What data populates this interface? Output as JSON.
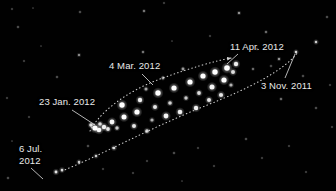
{
  "figure": {
    "kind": "sky-chart",
    "background_color": "#010101",
    "label_color": "#e9e9e9",
    "marker_color": "#ffffff",
    "width": 336,
    "height": 191
  },
  "labels": [
    {
      "id": "apr",
      "text": "11 Apr. 2012",
      "x": 230,
      "y": 42
    },
    {
      "id": "mar",
      "text": "4 Mar. 2012",
      "x": 109,
      "y": 61
    },
    {
      "id": "nov",
      "text": "3 Nov. 2011",
      "x": 261,
      "y": 81
    },
    {
      "id": "jan",
      "text": "23 Jan. 2012",
      "x": 39,
      "y": 97
    }
  ],
  "labels_multiline": [
    {
      "id": "jul",
      "line1": "6 Jul.",
      "line2": "2012",
      "x": 19,
      "y": 143
    }
  ],
  "leader_lines": [
    {
      "id": "leader-apr",
      "x1": 238,
      "y1": 54,
      "x2": 227,
      "y2": 64
    },
    {
      "id": "leader-mar",
      "x1": 142,
      "y1": 74,
      "x2": 153,
      "y2": 85
    },
    {
      "id": "leader-nov",
      "x1": 285,
      "y1": 78,
      "x2": 295,
      "y2": 54
    },
    {
      "id": "leader-jan",
      "x1": 72,
      "y1": 110,
      "x2": 95,
      "y2": 125
    },
    {
      "id": "leader-jul",
      "x1": 31,
      "y1": 168,
      "x2": 43,
      "y2": 179
    }
  ],
  "paths": [
    {
      "id": "upper-track",
      "description": "upper dotted retrograde track, 23 Jan. 2012 through 11 Apr. 2012",
      "d": "M 90 131 C 99 113, 125 92, 160 79 C 190 68, 215 61, 231 58"
    },
    {
      "id": "lower-track",
      "description": "lower dotted direct track, 6 Jul. 2012 through 3 Nov. 2011",
      "d": "M 62 171 C 95 158, 150 128, 205 106 C 250 88, 285 70, 298 52"
    }
  ],
  "markers": [
    {
      "x": 95,
      "y": 128,
      "r": 2.6,
      "b": 1.0
    },
    {
      "x": 99,
      "y": 130,
      "r": 2.3,
      "b": 0.95
    },
    {
      "x": 104,
      "y": 127,
      "r": 2.2,
      "b": 0.9
    },
    {
      "x": 91,
      "y": 125,
      "r": 1.8,
      "b": 0.8
    },
    {
      "x": 100,
      "y": 124,
      "r": 1.8,
      "b": 0.8
    },
    {
      "x": 108,
      "y": 129,
      "r": 1.9,
      "b": 0.85
    },
    {
      "x": 112,
      "y": 122,
      "r": 2.4,
      "b": 0.95
    },
    {
      "x": 117,
      "y": 128,
      "r": 1.7,
      "b": 0.7
    },
    {
      "x": 124,
      "y": 117,
      "r": 2.5,
      "b": 1.0
    },
    {
      "x": 122,
      "y": 105,
      "r": 2.7,
      "b": 1.0
    },
    {
      "x": 134,
      "y": 126,
      "r": 2.0,
      "b": 0.85
    },
    {
      "x": 137,
      "y": 112,
      "r": 2.6,
      "b": 1.0
    },
    {
      "x": 140,
      "y": 100,
      "r": 2.2,
      "b": 0.9
    },
    {
      "x": 147,
      "y": 131,
      "r": 1.8,
      "b": 0.75
    },
    {
      "x": 152,
      "y": 120,
      "r": 1.6,
      "b": 0.6
    },
    {
      "x": 155,
      "y": 107,
      "r": 2.0,
      "b": 0.85
    },
    {
      "x": 158,
      "y": 93,
      "r": 2.7,
      "b": 1.0
    },
    {
      "x": 166,
      "y": 116,
      "r": 2.4,
      "b": 0.95
    },
    {
      "x": 170,
      "y": 103,
      "r": 1.8,
      "b": 0.75
    },
    {
      "x": 174,
      "y": 88,
      "r": 2.6,
      "b": 1.0
    },
    {
      "x": 180,
      "y": 112,
      "r": 2.3,
      "b": 0.9
    },
    {
      "x": 186,
      "y": 98,
      "r": 1.7,
      "b": 0.7
    },
    {
      "x": 190,
      "y": 82,
      "r": 2.6,
      "b": 1.0
    },
    {
      "x": 196,
      "y": 108,
      "r": 2.2,
      "b": 0.9
    },
    {
      "x": 199,
      "y": 93,
      "r": 1.9,
      "b": 0.8
    },
    {
      "x": 203,
      "y": 76,
      "r": 2.6,
      "b": 1.0
    },
    {
      "x": 209,
      "y": 100,
      "r": 2.0,
      "b": 0.85
    },
    {
      "x": 212,
      "y": 87,
      "r": 2.5,
      "b": 0.95
    },
    {
      "x": 215,
      "y": 72,
      "r": 2.7,
      "b": 1.0
    },
    {
      "x": 221,
      "y": 95,
      "r": 2.1,
      "b": 0.85
    },
    {
      "x": 224,
      "y": 80,
      "r": 2.6,
      "b": 1.0
    },
    {
      "x": 227,
      "y": 68,
      "r": 2.8,
      "b": 1.0
    },
    {
      "x": 233,
      "y": 72,
      "r": 2.0,
      "b": 0.8
    },
    {
      "x": 236,
      "y": 64,
      "r": 2.2,
      "b": 0.9
    },
    {
      "x": 231,
      "y": 85,
      "r": 1.6,
      "b": 0.6
    },
    {
      "x": 146,
      "y": 89,
      "r": 1.5,
      "b": 0.55
    },
    {
      "x": 163,
      "y": 78,
      "r": 1.4,
      "b": 0.5
    },
    {
      "x": 183,
      "y": 69,
      "r": 1.4,
      "b": 0.5
    }
  ],
  "stars": [
    {
      "x": 12,
      "y": 9,
      "r": 0.7,
      "b": 0.35
    },
    {
      "x": 33,
      "y": 8,
      "r": 0.6,
      "b": 0.3
    },
    {
      "x": 80,
      "y": 12,
      "r": 0.8,
      "b": 0.4
    },
    {
      "x": 144,
      "y": 11,
      "r": 0.9,
      "b": 0.5
    },
    {
      "x": 239,
      "y": 13,
      "r": 1.0,
      "b": 0.6
    },
    {
      "x": 164,
      "y": 3,
      "r": 0.7,
      "b": 0.35
    },
    {
      "x": 18,
      "y": 27,
      "r": 0.8,
      "b": 0.4
    },
    {
      "x": 79,
      "y": 55,
      "r": 1.0,
      "b": 0.55
    },
    {
      "x": 143,
      "y": 52,
      "r": 0.9,
      "b": 0.5
    },
    {
      "x": 266,
      "y": 32,
      "r": 0.9,
      "b": 0.45
    },
    {
      "x": 316,
      "y": 42,
      "r": 1.2,
      "b": 0.75
    },
    {
      "x": 296,
      "y": 52,
      "r": 1.2,
      "b": 0.8
    },
    {
      "x": 279,
      "y": 59,
      "r": 1.0,
      "b": 0.6
    },
    {
      "x": 257,
      "y": 49,
      "r": 0.8,
      "b": 0.4
    },
    {
      "x": 253,
      "y": 69,
      "r": 0.9,
      "b": 0.45
    },
    {
      "x": 271,
      "y": 66,
      "r": 0.8,
      "b": 0.4
    },
    {
      "x": 303,
      "y": 76,
      "r": 0.8,
      "b": 0.4
    },
    {
      "x": 327,
      "y": 17,
      "r": 0.8,
      "b": 0.4
    },
    {
      "x": 330,
      "y": 85,
      "r": 0.7,
      "b": 0.35
    },
    {
      "x": 281,
      "y": 99,
      "r": 0.9,
      "b": 0.45
    },
    {
      "x": 316,
      "y": 108,
      "r": 0.8,
      "b": 0.4
    },
    {
      "x": 332,
      "y": 127,
      "r": 0.7,
      "b": 0.35
    },
    {
      "x": 24,
      "y": 61,
      "r": 0.7,
      "b": 0.35
    },
    {
      "x": 57,
      "y": 77,
      "r": 0.8,
      "b": 0.4
    },
    {
      "x": 7,
      "y": 98,
      "r": 0.7,
      "b": 0.35
    },
    {
      "x": 29,
      "y": 117,
      "r": 0.7,
      "b": 0.35
    },
    {
      "x": 12,
      "y": 141,
      "r": 0.6,
      "b": 0.3
    },
    {
      "x": 8,
      "y": 178,
      "r": 0.8,
      "b": 0.4
    },
    {
      "x": 56,
      "y": 172,
      "r": 1.4,
      "b": 0.85
    },
    {
      "x": 62,
      "y": 170,
      "r": 1.3,
      "b": 0.8
    },
    {
      "x": 79,
      "y": 162,
      "r": 1.2,
      "b": 0.75
    },
    {
      "x": 96,
      "y": 156,
      "r": 1.2,
      "b": 0.7
    },
    {
      "x": 114,
      "y": 148,
      "r": 1.3,
      "b": 0.8
    },
    {
      "x": 88,
      "y": 146,
      "r": 0.8,
      "b": 0.4
    },
    {
      "x": 103,
      "y": 169,
      "r": 0.7,
      "b": 0.35
    },
    {
      "x": 133,
      "y": 173,
      "r": 0.7,
      "b": 0.35
    },
    {
      "x": 147,
      "y": 161,
      "r": 0.7,
      "b": 0.35
    },
    {
      "x": 174,
      "y": 153,
      "r": 0.8,
      "b": 0.4
    },
    {
      "x": 198,
      "y": 148,
      "r": 0.7,
      "b": 0.35
    },
    {
      "x": 214,
      "y": 166,
      "r": 0.7,
      "b": 0.35
    },
    {
      "x": 246,
      "y": 139,
      "r": 0.8,
      "b": 0.4
    },
    {
      "x": 262,
      "y": 158,
      "r": 0.7,
      "b": 0.35
    },
    {
      "x": 289,
      "y": 146,
      "r": 0.7,
      "b": 0.35
    },
    {
      "x": 306,
      "y": 172,
      "r": 0.7,
      "b": 0.35
    },
    {
      "x": 182,
      "y": 181,
      "r": 0.6,
      "b": 0.3
    },
    {
      "x": 122,
      "y": 66,
      "r": 0.6,
      "b": 0.3
    },
    {
      "x": 210,
      "y": 36,
      "r": 0.7,
      "b": 0.35
    },
    {
      "x": 172,
      "y": 41,
      "r": 0.6,
      "b": 0.3
    },
    {
      "x": 64,
      "y": 101,
      "r": 0.6,
      "b": 0.3
    },
    {
      "x": 41,
      "y": 46,
      "r": 0.6,
      "b": 0.3
    }
  ]
}
